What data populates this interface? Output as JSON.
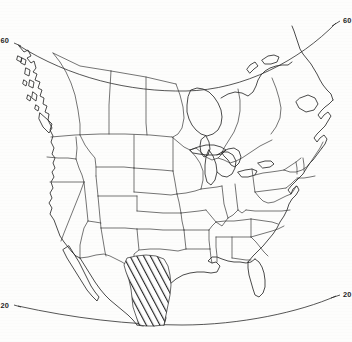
{
  "figure": {
    "projection": "conic",
    "background_color": "#fdfdfc",
    "line_color": "#2b2b2b"
  },
  "graticule": {
    "parallels": [
      {
        "id": "parallel-60",
        "value": "60",
        "label_left": "60",
        "label_right": "60",
        "position": "top"
      },
      {
        "id": "parallel-20",
        "value": "20",
        "label_left": "20",
        "label_right": "20",
        "position": "bottom"
      }
    ]
  },
  "overlay": {
    "hatched_region": {
      "name": "hatched-region",
      "pattern": "diagonal-hatch",
      "location": "northeastern-mexico-south-texas",
      "hatch_color": "#262626"
    }
  },
  "layers": [
    {
      "name": "coastline",
      "stroke": "#2b2b2b"
    },
    {
      "name": "state-boundaries",
      "stroke": "#3a3a3a"
    },
    {
      "name": "province-boundaries",
      "stroke": "#3a3a3a"
    },
    {
      "name": "national-boundaries",
      "stroke": "#3a3a3a"
    }
  ]
}
